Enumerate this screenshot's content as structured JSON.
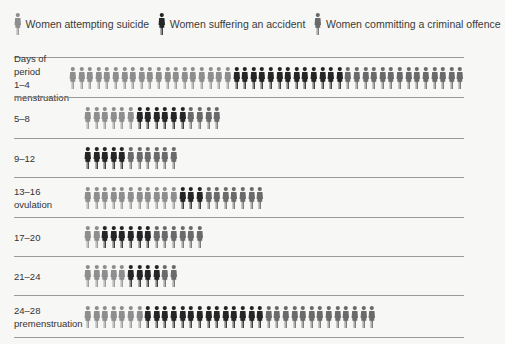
{
  "legend": [
    {
      "label": "Women attempting suicide",
      "color": "#8e8e8e",
      "key": "suicide"
    },
    {
      "label": "Women suffering an accident",
      "color": "#252525",
      "key": "accident"
    },
    {
      "label": "Women committing a criminal offence",
      "color": "#6a6a6a",
      "key": "criminal"
    }
  ],
  "header_label": "Days of period",
  "rows": [
    {
      "label": "1–4",
      "sublabel": "menstruation",
      "suicide": 19,
      "accident": 13,
      "criminal": 14
    },
    {
      "label": "5–8",
      "sublabel": "",
      "suicide": 6,
      "accident": 6,
      "criminal": 4
    },
    {
      "label": "9–12",
      "sublabel": "",
      "suicide": 0,
      "accident": 5,
      "criminal": 6
    },
    {
      "label": "13–16",
      "sublabel": "ovulation",
      "suicide": 11,
      "accident": 3,
      "criminal": 7
    },
    {
      "label": "17–20",
      "sublabel": "",
      "suicide": 2,
      "accident": 6,
      "criminal": 6
    },
    {
      "label": "21–24",
      "sublabel": "",
      "suicide": 5,
      "accident": 4,
      "criminal": 2
    },
    {
      "label": "24–28",
      "sublabel": "premenstruation",
      "suicide": 7,
      "accident": 14,
      "criminal": 13
    }
  ],
  "chart_data": {
    "type": "bar",
    "title": "",
    "xlabel": "",
    "ylabel": "Days of period",
    "categories": [
      "1–4 menstruation",
      "5–8",
      "9–12",
      "13–16 ovulation",
      "17–20",
      "21–24",
      "24–28 premenstruation"
    ],
    "series": [
      {
        "name": "Women attempting suicide",
        "values": [
          19,
          6,
          0,
          11,
          2,
          5,
          7
        ]
      },
      {
        "name": "Women suffering an accident",
        "values": [
          13,
          6,
          5,
          3,
          6,
          4,
          14
        ]
      },
      {
        "name": "Women committing a criminal offence",
        "values": [
          14,
          4,
          6,
          7,
          6,
          2,
          13
        ]
      }
    ],
    "stacked": true,
    "orientation": "horizontal",
    "legend_position": "top",
    "grid": false
  }
}
